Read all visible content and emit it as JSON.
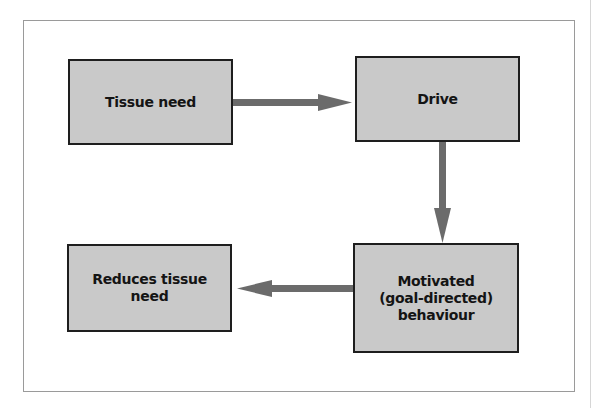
{
  "diagram": {
    "nodes": [
      {
        "id": "tissue-need",
        "label": "Tissue need"
      },
      {
        "id": "drive",
        "label": "Drive"
      },
      {
        "id": "motivated-behaviour",
        "label": "Motivated\n(goal-directed)\nbehaviour"
      },
      {
        "id": "reduces-tissue-need",
        "label": "Reduces tissue\nneed"
      }
    ],
    "edges": [
      {
        "from": "tissue-need",
        "to": "drive"
      },
      {
        "from": "drive",
        "to": "motivated-behaviour"
      },
      {
        "from": "motivated-behaviour",
        "to": "reduces-tissue-need"
      }
    ],
    "colors": {
      "node_fill": "#c9c9c9",
      "node_border": "#1e1e1e",
      "arrow": "#6b6b6b",
      "frame": "#9a9a9a"
    }
  }
}
